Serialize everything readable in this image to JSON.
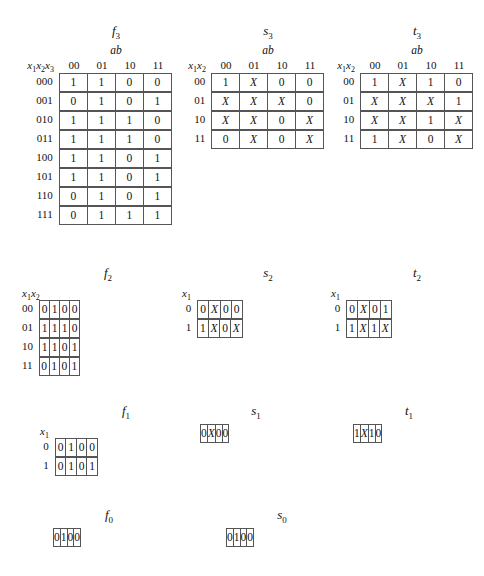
{
  "figure": {
    "column_group_label": "ab",
    "col_headers": [
      "00",
      "01",
      "10",
      "11"
    ]
  },
  "tables": [
    {
      "id": "f3",
      "name_base": "f",
      "name_sub": "3",
      "show_ab": true,
      "row_var_base": "x",
      "row_var_label": "x1x2x3",
      "row_labels": [
        "000",
        "001",
        "010",
        "011",
        "100",
        "101",
        "110",
        "111"
      ],
      "rows": [
        [
          "1",
          "1",
          "0",
          "0"
        ],
        [
          "0",
          "1",
          "0",
          "1"
        ],
        [
          "1",
          "1",
          "1",
          "0"
        ],
        [
          "1",
          "1",
          "1",
          "0"
        ],
        [
          "1",
          "1",
          "0",
          "1"
        ],
        [
          "1",
          "1",
          "0",
          "1"
        ],
        [
          "0",
          "1",
          "0",
          "1"
        ],
        [
          "0",
          "1",
          "1",
          "1"
        ]
      ]
    },
    {
      "id": "s3",
      "name_base": "s",
      "name_sub": "3",
      "show_ab": true,
      "row_var_label": "x1x2",
      "row_labels": [
        "00",
        "01",
        "10",
        "11"
      ],
      "rows": [
        [
          "1",
          "X",
          "0",
          "0"
        ],
        [
          "X",
          "X",
          "X",
          "0"
        ],
        [
          "X",
          "X",
          "0",
          "X"
        ],
        [
          "0",
          "X",
          "0",
          "X"
        ]
      ]
    },
    {
      "id": "t3",
      "name_base": "t",
      "name_sub": "3",
      "show_ab": true,
      "row_var_label": "x1x2",
      "row_labels": [
        "00",
        "01",
        "10",
        "11"
      ],
      "rows": [
        [
          "1",
          "X",
          "1",
          "0"
        ],
        [
          "X",
          "X",
          "X",
          "1"
        ],
        [
          "X",
          "X",
          "1",
          "X"
        ],
        [
          "1",
          "X",
          "0",
          "X"
        ]
      ]
    },
    {
      "id": "f2",
      "name_base": "f",
      "name_sub": "2",
      "show_ab": false,
      "row_var_label": "x1x2",
      "row_labels": [
        "00",
        "01",
        "10",
        "11"
      ],
      "rows": [
        [
          "0",
          "1",
          "0",
          "0"
        ],
        [
          "1",
          "1",
          "1",
          "0"
        ],
        [
          "1",
          "1",
          "0",
          "1"
        ],
        [
          "0",
          "1",
          "0",
          "1"
        ]
      ]
    },
    {
      "id": "s2",
      "name_base": "s",
      "name_sub": "2",
      "show_ab": false,
      "row_var_label": "x1",
      "row_labels": [
        "0",
        "1"
      ],
      "rows": [
        [
          "0",
          "X",
          "0",
          "0"
        ],
        [
          "1",
          "X",
          "0",
          "X"
        ]
      ]
    },
    {
      "id": "t2",
      "name_base": "t",
      "name_sub": "2",
      "show_ab": false,
      "row_var_label": "x1",
      "row_labels": [
        "0",
        "1"
      ],
      "rows": [
        [
          "0",
          "X",
          "0",
          "1"
        ],
        [
          "1",
          "X",
          "1",
          "X"
        ]
      ]
    },
    {
      "id": "f1",
      "name_base": "f",
      "name_sub": "1",
      "show_ab": false,
      "row_var_label": "x1",
      "row_labels": [
        "0",
        "1"
      ],
      "rows": [
        [
          "0",
          "1",
          "0",
          "0"
        ],
        [
          "0",
          "1",
          "0",
          "1"
        ]
      ]
    },
    {
      "id": "s1",
      "name_base": "s",
      "name_sub": "1",
      "show_ab": false,
      "row_var_label": "",
      "row_labels": [
        ""
      ],
      "rows": [
        [
          "0",
          "X",
          "0",
          "0"
        ]
      ]
    },
    {
      "id": "t1",
      "name_base": "t",
      "name_sub": "1",
      "show_ab": false,
      "row_var_label": "",
      "row_labels": [
        ""
      ],
      "rows": [
        [
          "1",
          "X",
          "1",
          "0"
        ]
      ]
    },
    {
      "id": "f0",
      "name_base": "f",
      "name_sub": "0",
      "show_ab": false,
      "row_var_label": "",
      "row_labels": [
        ""
      ],
      "rows": [
        [
          "0",
          "1",
          "0",
          "0"
        ]
      ]
    },
    {
      "id": "s0",
      "name_base": "s",
      "name_sub": "0",
      "show_ab": false,
      "row_var_label": "",
      "row_labels": [
        ""
      ],
      "rows": [
        [
          "0",
          "1",
          "0",
          "0"
        ]
      ]
    }
  ],
  "layout": {
    "f3": {
      "left": 14,
      "top": 24,
      "rlbl": "wide"
    },
    "s3": {
      "left": 182,
      "top": 24,
      "rlbl": "narrow"
    },
    "t3": {
      "left": 331,
      "top": 24,
      "rlbl": "narrow"
    },
    "f2": {
      "left": 22,
      "top": 266,
      "rlbl": "narrow"
    },
    "s2": {
      "left": 182,
      "top": 266,
      "rlbl": "narrow"
    },
    "t2": {
      "left": 331,
      "top": 266,
      "rlbl": "narrow"
    },
    "f1": {
      "left": 40,
      "top": 404,
      "rlbl": "narrow"
    },
    "s1": {
      "left": 200,
      "top": 404,
      "rlbl": "none"
    },
    "t1": {
      "left": 353,
      "top": 404,
      "rlbl": "none"
    },
    "f0": {
      "left": 53,
      "top": 508,
      "rlbl": "none"
    },
    "s0": {
      "left": 226,
      "top": 508,
      "rlbl": "none"
    }
  }
}
